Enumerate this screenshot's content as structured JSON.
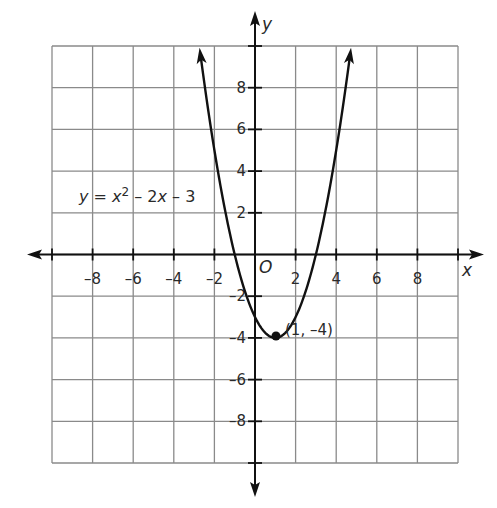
{
  "chart_data": {
    "type": "line",
    "title": "",
    "function": "y = x^2 - 2x - 3",
    "equation_label": {
      "y": "y",
      "eq": " = ",
      "x1": "x",
      "sup": "2",
      "mid": " – 2",
      "x2": "x",
      "end": " – 3"
    },
    "xlabel": "x",
    "ylabel": "y",
    "origin_label": "O",
    "xlim": [
      -10,
      10
    ],
    "ylim": [
      -10,
      10
    ],
    "grid": true,
    "grid_step": 2,
    "x_ticks": [
      -8,
      -6,
      -4,
      -2,
      2,
      4,
      6,
      8
    ],
    "x_tick_labels": [
      "–8",
      "–6",
      "–4",
      "–2",
      "2",
      "4",
      "6",
      "8"
    ],
    "y_ticks": [
      8,
      6,
      4,
      2,
      -2,
      -4,
      -6,
      -8
    ],
    "y_tick_labels": [
      "8",
      "6",
      "4",
      "2",
      "–2",
      "–4",
      "–6",
      "–8"
    ],
    "series": [
      {
        "name": "y = x² – 2x – 3",
        "x": [
          -2.74,
          -2,
          -1,
          0,
          1,
          2,
          3,
          4,
          4.74
        ],
        "y": [
          10,
          5,
          0,
          -3,
          -4,
          -3,
          0,
          5,
          10
        ]
      }
    ],
    "points": [
      {
        "x": 1,
        "y": -4,
        "label": "(1, –4)"
      }
    ],
    "colors": {
      "grid": "#8a8a8a",
      "axis": "#111111",
      "curve": "#111111"
    }
  }
}
